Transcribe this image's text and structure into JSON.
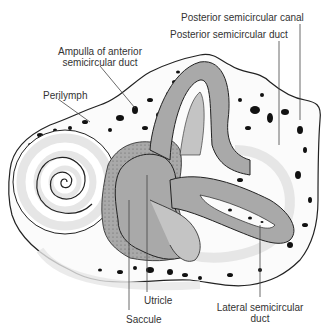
{
  "figure": {
    "colors": {
      "background": "#ffffff",
      "bone": "#fbfbfb",
      "bone_pores": "#111111",
      "outline": "#222222",
      "membranous_duct": "#a9a9a9",
      "membranous_duct_light": "#c4c4c4",
      "perilymph_band": "#e6e6e6",
      "label_text": "#333333",
      "leader_line": "#444444"
    }
  },
  "labels": {
    "posterior_canal": "Posterior semicircular canal",
    "posterior_duct": "Posterior semicircular duct",
    "ampulla_line1": "Ampulla of anterior",
    "ampulla_line2": "semicircular duct",
    "perilymph": "Perilymph",
    "utricle": "Utricle",
    "saccule": "Saccule",
    "lateral_line1": "Lateral semicircular",
    "lateral_line2": "duct"
  }
}
